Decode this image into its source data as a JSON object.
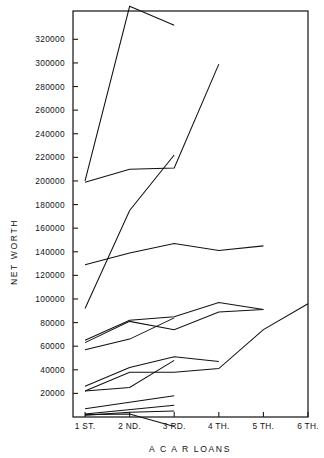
{
  "chart_data": {
    "type": "line",
    "title": "",
    "xlabel": "A C A R   LOANS",
    "ylabel": "NET WORTH",
    "grid": false,
    "legend": "none",
    "x_categories": [
      "1 ST.",
      "2 ND.",
      "3 RD.",
      "4 TH.",
      "5 TH.",
      "6 TH."
    ],
    "x_indices": [
      1,
      2,
      3,
      4,
      5,
      6
    ],
    "ylim": [
      0,
      344000
    ],
    "xlim": [
      0.73,
      6.0
    ],
    "y_tick_values": [
      20000,
      40000,
      60000,
      80000,
      100000,
      120000,
      140000,
      160000,
      180000,
      200000,
      220000,
      240000,
      260000,
      280000,
      300000,
      320000
    ],
    "y_tick_labels": [
      "20000",
      "40000",
      "60000",
      "80000",
      "100000",
      "120000",
      "140000",
      "160000",
      "180000",
      "200000",
      "220000",
      "240000",
      "260000",
      "280000",
      "300000",
      "320000"
    ],
    "series": [
      {
        "name": "borrower-1",
        "x": [
          1,
          2,
          3
        ],
        "values": [
          200000,
          348000,
          332000
        ]
      },
      {
        "name": "borrower-2",
        "x": [
          1,
          2,
          3,
          4
        ],
        "values": [
          199000,
          210000,
          211000,
          299000
        ]
      },
      {
        "name": "borrower-3",
        "x": [
          1,
          2,
          3
        ],
        "values": [
          92000,
          175000,
          222000
        ]
      },
      {
        "name": "borrower-4",
        "x": [
          1,
          2,
          3,
          4,
          5
        ],
        "values": [
          129000,
          139000,
          147000,
          141000,
          145000
        ]
      },
      {
        "name": "borrower-5",
        "x": [
          1,
          2,
          3,
          4,
          5
        ],
        "values": [
          65000,
          82000,
          85000,
          97000,
          91000
        ]
      },
      {
        "name": "borrower-6",
        "x": [
          1,
          2,
          3,
          4,
          5
        ],
        "values": [
          63000,
          81000,
          74000,
          89000,
          91000
        ]
      },
      {
        "name": "borrower-7",
        "x": [
          1,
          2,
          3
        ],
        "values": [
          57000,
          66000,
          84000
        ]
      },
      {
        "name": "borrower-8",
        "x": [
          1,
          2,
          3,
          4
        ],
        "values": [
          26000,
          42000,
          51000,
          47000
        ]
      },
      {
        "name": "borrower-9",
        "x": [
          1,
          2,
          3,
          4,
          5,
          6
        ],
        "values": [
          22000,
          38000,
          38000,
          41000,
          74000,
          96000
        ]
      },
      {
        "name": "borrower-10",
        "x": [
          1,
          2,
          3
        ],
        "values": [
          22000,
          25000,
          48000
        ]
      },
      {
        "name": "borrower-11",
        "x": [
          1,
          3
        ],
        "values": [
          7000,
          18000
        ]
      },
      {
        "name": "borrower-12",
        "x": [
          1,
          3
        ],
        "values": [
          2500,
          10000
        ]
      },
      {
        "name": "borrower-13",
        "x": [
          1,
          2,
          3
        ],
        "values": [
          1500,
          4000,
          5000
        ]
      },
      {
        "name": "borrower-14",
        "x": [
          1,
          2,
          3
        ],
        "values": [
          2000,
          2500,
          -8000
        ]
      }
    ]
  },
  "axes": {
    "y_title": "NET WORTH",
    "x_title": "A C A R   LOANS"
  }
}
